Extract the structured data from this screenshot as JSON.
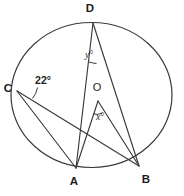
{
  "figure": {
    "background_color": "#ffffff",
    "stroke_color": "#3a3a3a",
    "text_color": "#1d1d1d",
    "width": 184,
    "height": 196
  },
  "circle": {
    "name": "main-circle",
    "center_x": 91.5,
    "center_y": 95,
    "radius": 80
  },
  "points": {
    "A": {
      "label": "A",
      "x": 76,
      "y": 168,
      "label_x": 74,
      "label_y": 182
    },
    "B": {
      "label": "B",
      "x": 139,
      "y": 166,
      "label_x": 145,
      "label_y": 180
    },
    "C": {
      "label": "C",
      "x": 17,
      "y": 91,
      "label_x": 8,
      "label_y": 89
    },
    "D": {
      "label": "D",
      "x": 93,
      "y": 23,
      "label_x": 90,
      "label_y": 9
    },
    "O": {
      "label": "O",
      "x": 98,
      "y": 101,
      "label_x": 97,
      "label_y": 88
    }
  },
  "segments": [
    {
      "name": "chord-CA",
      "from": "C",
      "to": "A"
    },
    {
      "name": "chord-CB",
      "from": "C",
      "to": "B"
    },
    {
      "name": "chord-DA",
      "from": "D",
      "to": "A"
    },
    {
      "name": "chord-DB",
      "from": "D",
      "to": "B"
    },
    {
      "name": "radius-OA",
      "from": "O",
      "to": "A"
    },
    {
      "name": "radius-OB",
      "from": "O",
      "to": "B"
    }
  ],
  "angles": {
    "at_C": {
      "name": "angle-ACB",
      "label": "22°",
      "label_x": 43,
      "label_y": 81,
      "vertex": "C"
    },
    "at_D": {
      "name": "angle-ADB",
      "label": "y°",
      "label_x": 89,
      "label_y": 56,
      "vertex": "D"
    },
    "at_O": {
      "name": "angle-AOB",
      "label": "x°",
      "label_x": 100,
      "label_y": 118,
      "vertex": "O"
    }
  }
}
